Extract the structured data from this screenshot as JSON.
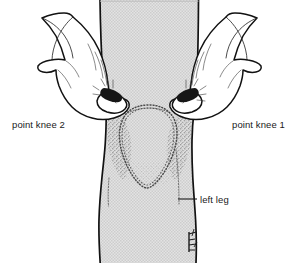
{
  "figure": {
    "background_color": "#ffffff",
    "ink_color": "#121212",
    "skin_fill_color": "#d8d8d8",
    "stipple_color": "#555555"
  },
  "annotations": [
    {
      "id": "point-knee-2",
      "label": "point knee 2",
      "side": "left",
      "text_x": 12,
      "text_y": 128,
      "anchor": "start"
    },
    {
      "id": "point-knee-1",
      "label": "point knee 1",
      "side": "right",
      "text_x": 232,
      "text_y": 128,
      "anchor": "start"
    },
    {
      "id": "left-leg",
      "label": "left leg",
      "side": "right",
      "text_x": 200,
      "text_y": 203,
      "anchor": "start"
    }
  ],
  "leader_lines": [
    {
      "id": "left-leg-leader",
      "x1": 178,
      "y1": 199,
      "x2": 197,
      "y2": 199
    }
  ],
  "anatomy": {
    "patella_label": "patella outline",
    "patella_style": "stippled dotted contour",
    "thigh_label": "thigh",
    "shin_label": "shin",
    "signature_label": "artist signature mark"
  },
  "hands": [
    {
      "id": "hand-right-of-viewer",
      "grips": "point knee 1",
      "thumb_contact_x": 188,
      "thumb_contact_y": 104
    },
    {
      "id": "hand-left-of-viewer",
      "grips": "point knee 2",
      "thumb_contact_x": 113,
      "thumb_contact_y": 104
    }
  ]
}
